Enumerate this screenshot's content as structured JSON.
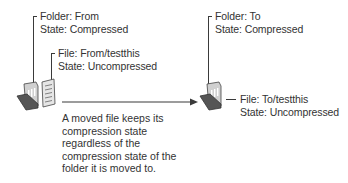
{
  "source": {
    "folder_label": "Folder: From",
    "folder_state": "State: Compressed",
    "file_label": "File: From/testthis",
    "file_state": "State: Uncompressed"
  },
  "destination": {
    "folder_label": "Folder: To",
    "folder_state": "State: Compressed",
    "file_label": "File: To/testthis",
    "file_state": "State: Uncompressed"
  },
  "note": {
    "lines": [
      "A moved file keeps its",
      "compression state",
      "regardless of the",
      "compression state of the",
      "folder it is moved to."
    ]
  },
  "icons": {
    "source_folder": "open-folder-icon",
    "source_file": "document-icon",
    "destination_folder": "open-folder-icon",
    "move_arrow": "arrow-right-icon"
  },
  "colors": {
    "line": "#3a3a3a",
    "folder_dark": "#555555",
    "folder_light": "#c8c8c8",
    "text": "#333333"
  }
}
